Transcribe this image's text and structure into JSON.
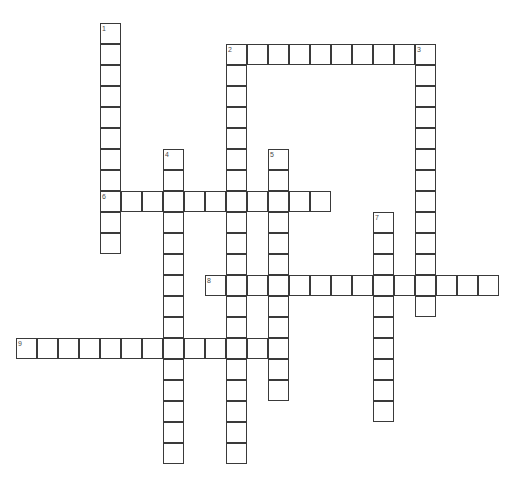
{
  "puzzle": {
    "title": "Crossword Grid",
    "grid": {
      "origin_x": 16,
      "origin_y": 23,
      "cell_size": 21,
      "cols": 23,
      "rows": 21,
      "cell_fill": "#ffffff",
      "cell_border": "#3a3a3a",
      "number_color": "#4a4a4a",
      "background": "#ffffff"
    },
    "entries": [
      {
        "number": "1",
        "direction": "down",
        "row": 0,
        "col": 4,
        "length": 11
      },
      {
        "number": "2",
        "direction": "across",
        "row": 1,
        "col": 10,
        "length": 9
      },
      {
        "number": "2",
        "direction": "down",
        "row": 1,
        "col": 10,
        "length": 20
      },
      {
        "number": "3",
        "direction": "down",
        "row": 1,
        "col": 19,
        "length": 13
      },
      {
        "number": "4",
        "direction": "down",
        "row": 6,
        "col": 7,
        "length": 15
      },
      {
        "number": "5",
        "direction": "down",
        "row": 6,
        "col": 12,
        "length": 12
      },
      {
        "number": "6",
        "direction": "across",
        "row": 8,
        "col": 4,
        "length": 11
      },
      {
        "number": "7",
        "direction": "down",
        "row": 9,
        "col": 17,
        "length": 10
      },
      {
        "number": "8",
        "direction": "across",
        "row": 12,
        "col": 9,
        "length": 14
      },
      {
        "number": "9",
        "direction": "across",
        "row": 15,
        "col": 0,
        "length": 13
      }
    ],
    "numbers": [
      {
        "label": "1",
        "row": 0,
        "col": 4
      },
      {
        "label": "2",
        "row": 1,
        "col": 10
      },
      {
        "label": "3",
        "row": 1,
        "col": 19
      },
      {
        "label": "4",
        "row": 6,
        "col": 7
      },
      {
        "label": "5",
        "row": 6,
        "col": 12
      },
      {
        "label": "6",
        "row": 8,
        "col": 4
      },
      {
        "label": "7",
        "row": 9,
        "col": 17
      },
      {
        "label": "8",
        "row": 12,
        "col": 9
      },
      {
        "label": "9",
        "row": 15,
        "col": 0
      }
    ]
  }
}
